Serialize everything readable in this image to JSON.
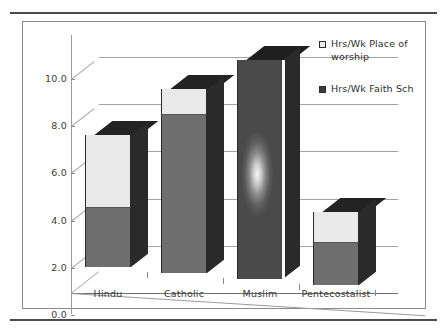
{
  "chart_data": {
    "type": "bar",
    "subtype": "stacked-column-3d",
    "title": "",
    "xlabel": "",
    "ylabel": "",
    "categories": [
      "Hindu",
      "Catholic",
      "Muslim",
      "Pentecostalist"
    ],
    "series": [
      {
        "name": "Hrs/Wk Faith Sch",
        "values": [
          2.5,
          6.7,
          9.3,
          1.8
        ],
        "color": "#6e6e6e",
        "marker": "filled-square"
      },
      {
        "name": "Hrs/Wk Place of worship",
        "values": [
          3.1,
          1.1,
          0.0,
          1.3
        ],
        "color": "#e9e9e9",
        "marker": "hollow-square"
      }
    ],
    "stack_totals": [
      5.6,
      7.8,
      9.3,
      3.1
    ],
    "ylim": [
      0.0,
      10.0
    ],
    "ytick_labels": [
      "0.0",
      "2.0",
      "4.0",
      "6.0",
      "8.0",
      "10.0"
    ],
    "ytick_values": [
      0.0,
      2.0,
      4.0,
      6.0,
      8.0,
      10.0
    ],
    "grid": true,
    "grid_axis": "y",
    "legend_position": "top-right",
    "legend_entries": [
      "Hrs/Wk Place of worship",
      "Hrs/Wk Faith Sch"
    ]
  },
  "legend": {
    "items": [
      {
        "label": "Hrs/Wk Place of worship",
        "swatch": "hollow-square"
      },
      {
        "label": "Hrs/Wk Faith Sch",
        "swatch": "filled-square"
      }
    ]
  },
  "colors": {
    "series_dark": "#6e6e6e",
    "series_light": "#e9e9e9",
    "bar_side": "#2a2a2a",
    "bar_top": "#1f1f1f",
    "gridline": "#a2a2a2",
    "axis": "#8a8a8a",
    "text": "#3a3a3a",
    "rule": "#4a4a4a",
    "frame": "#8a8a8a"
  }
}
